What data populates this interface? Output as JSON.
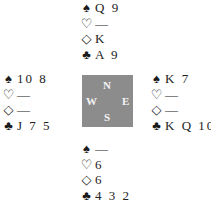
{
  "compass": {
    "north": "N",
    "south": "S",
    "east": "E",
    "west": "W"
  },
  "symbols": {
    "spades": "♠",
    "hearts": "♡",
    "diamonds": "◇",
    "clubs": "♣"
  },
  "hands": {
    "north": {
      "spades": "Q 9",
      "hearts": "—",
      "diamonds": "K",
      "clubs": "A 9"
    },
    "west": {
      "spades": "10 8",
      "hearts": "—",
      "diamonds": "—",
      "clubs": "J 7 5"
    },
    "east": {
      "spades": "K 7",
      "hearts": "—",
      "diamonds": "—",
      "clubs": "K Q 10"
    },
    "south": {
      "spades": "—",
      "hearts": "6",
      "diamonds": "6",
      "clubs": "4 3 2"
    }
  }
}
